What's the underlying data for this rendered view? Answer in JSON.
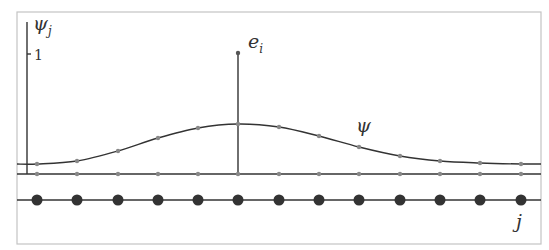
{
  "diagram": {
    "y_axis_label": "ψ",
    "y_axis_sub": "j",
    "y_tick_label": "1",
    "spike_label": "e",
    "spike_sub": "i",
    "curve_label": "ψ",
    "x_axis_label": "j",
    "node_x": [
      37,
      77,
      118,
      158,
      198,
      238,
      279,
      319,
      359,
      400,
      440,
      480,
      521
    ],
    "psi_y": [
      164,
      161,
      151,
      138,
      128,
      124,
      127,
      136,
      147,
      156,
      161,
      163,
      164
    ],
    "spike_index": 5,
    "colors": {
      "line": "#333333",
      "small_dot": "#888888",
      "big_dot": "#333333",
      "frame": "#bbbbbb"
    }
  }
}
